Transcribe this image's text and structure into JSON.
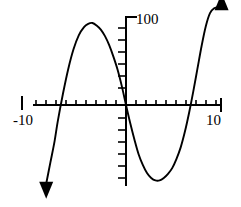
{
  "figure": {
    "background_color": "#ffffff",
    "stroke_color": "#000000"
  },
  "axes": {
    "x_axis_name": "horizontal-axis",
    "y_axis_name": "vertical-axis",
    "x_min_label": "-10",
    "x_max_label": "10",
    "y_max_label": "100",
    "x_origin_px": 126,
    "y_origin_px": 105
  },
  "chart_data": {
    "type": "line",
    "title": "",
    "subtitle": "",
    "xlabel": "",
    "ylabel": "",
    "xlim": [
      -10,
      10
    ],
    "ylim": [
      -100,
      120
    ],
    "grid": false,
    "legend": false,
    "legend_position": "none",
    "x_tick_labels": [
      "-10",
      "10"
    ],
    "y_tick_labels": [
      "100"
    ],
    "x_tick_interval": 1,
    "y_tick_interval": 20,
    "annotations": [
      {
        "name": "arrow-up-right",
        "label": "",
        "direction": "up",
        "x": 9.1,
        "y": 118
      },
      {
        "name": "arrow-down-left",
        "label": "",
        "direction": "down",
        "x": -7.6,
        "y": -96
      }
    ],
    "series": [
      {
        "name": "cubic-curve",
        "color": "#000000",
        "x": [
          -7.6,
          -7.2,
          -6.8,
          -6.5,
          -6.0,
          -5.5,
          -5.0,
          -4.5,
          -4.0,
          -3.6,
          -3.2,
          -2.8,
          -2.4,
          -2.0,
          -1.6,
          -1.2,
          -0.8,
          -0.4,
          0.0,
          0.4,
          0.8,
          1.2,
          1.6,
          2.0,
          2.4,
          2.8,
          3.2,
          3.6,
          4.0,
          4.4,
          4.8,
          5.2,
          5.6,
          6.0,
          6.4,
          6.8,
          7.2,
          7.6,
          8.0,
          8.4,
          8.8,
          9.1
        ],
        "y": [
          -96,
          -70,
          -44,
          -20,
          14,
          44,
          68,
          85,
          95,
          99,
          100,
          97,
          92,
          84,
          73,
          59,
          43,
          23,
          0,
          -22,
          -42,
          -60,
          -73,
          -83,
          -89,
          -92,
          -92,
          -89,
          -84,
          -77,
          -66,
          -52,
          -33,
          -10,
          16,
          44,
          72,
          96,
          112,
          118,
          119,
          118
        ]
      }
    ]
  }
}
